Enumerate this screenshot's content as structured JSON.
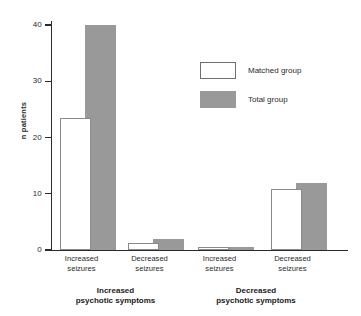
{
  "chart_data": {
    "type": "bar",
    "title": "",
    "xlabel": "",
    "ylabel": "n patients",
    "ylim": [
      0,
      40
    ],
    "yticks": [
      0,
      10,
      20,
      30,
      40
    ],
    "ytick_labels": [
      "0",
      "10",
      "20",
      "30",
      "40"
    ],
    "grid": false,
    "legend_position": "upper right",
    "categories": [
      "Increased seizures",
      "Decreased seizures",
      "Increased seizures",
      "Decreased seizures"
    ],
    "category_lines": [
      [
        "Increased",
        "seizures"
      ],
      [
        "Decreased",
        "seizures"
      ],
      [
        "Increased",
        "seizures"
      ],
      [
        "Decreased",
        "seizures"
      ]
    ],
    "group_labels": [
      {
        "line1": "Increased",
        "line2": "psychotic symptoms"
      },
      {
        "line1": "Decreased",
        "line2": "psychotic symptoms"
      }
    ],
    "series": [
      {
        "name": "Matched group",
        "color": "#ffffff",
        "values": [
          23.5,
          1.2,
          0.5,
          10.8
        ]
      },
      {
        "name": "Total group",
        "color": "#999999",
        "values": [
          40,
          2,
          0.5,
          12
        ]
      }
    ]
  },
  "legend": {
    "items": [
      {
        "label": "Matched group",
        "swatch": "matched-swatch"
      },
      {
        "label": "Total group",
        "swatch": "total-swatch"
      }
    ]
  }
}
